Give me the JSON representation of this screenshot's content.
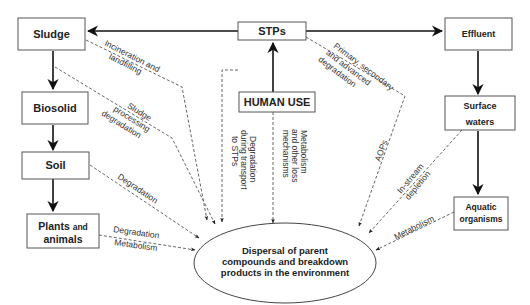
{
  "diagram": {
    "nodes": {
      "sludge": {
        "label": "Sludge"
      },
      "stps": {
        "label": "STPs"
      },
      "effluent": {
        "label": "Effluent"
      },
      "biosolid": {
        "label": "Biosolid"
      },
      "human_use": {
        "label": "HUMAN USE"
      },
      "surface_waters": {
        "line1": "Surface",
        "line2": "waters"
      },
      "soil": {
        "label": "Soil"
      },
      "plants_animals": {
        "line1_bold": "Plants",
        "line1_small": "and",
        "line2": "animals"
      },
      "aquatic_organisms": {
        "line1": "Aquatic",
        "line2": "organisms"
      },
      "dispersal": {
        "line1": "Dispersal of parent",
        "line2": "compounds and breakdown",
        "line3": "products in the environment"
      }
    },
    "edge_labels": {
      "incineration": {
        "line1": "Incineration and",
        "line2": "landfilling"
      },
      "sludge_processing": {
        "line1": "Sludge",
        "line2": "processing",
        "line3": "degradation"
      },
      "soil_degradation": "Degradation",
      "plants_degradation": "Degradation",
      "plants_metabolism": "Metabolism",
      "transport": {
        "line1": "Degradation",
        "line2": "during transport",
        "line3": "to STPs"
      },
      "human_metabolism": {
        "line1": "Metabolism",
        "line2": "and other loss",
        "line3": "mechanisms"
      },
      "stp_degradation": {
        "line1": "Primary, secondary",
        "line2": "and advanced",
        "line3": "degradation"
      },
      "aops": "AOPs",
      "instream": {
        "line1": "In-stream",
        "line2": "depletion"
      },
      "aquatic_metabolism": "Metabolism"
    }
  }
}
